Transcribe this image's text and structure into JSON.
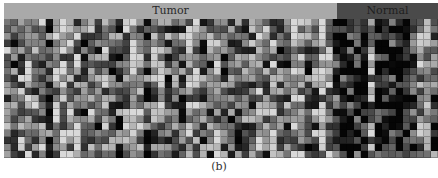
{
  "chart_data": {
    "type": "heatmap",
    "title": "",
    "caption": "(b)",
    "groups": [
      {
        "name": "Tumor",
        "columns": 48,
        "header_color": "#a9a9a9"
      },
      {
        "name": "Normal",
        "columns": 14,
        "header_color": "#4a4a4a"
      }
    ],
    "n_rows": 20,
    "n_cols": 62,
    "colormap": "grayscale (black = low, white = high)",
    "grid": true,
    "legend": "none",
    "xlabel": "",
    "ylabel": ""
  },
  "header": {
    "tumor_label": "Tumor",
    "normal_label": "Normal"
  },
  "caption": "(b)"
}
